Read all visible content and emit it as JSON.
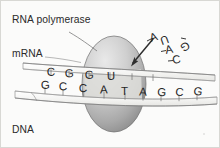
{
  "figure": {
    "background_color": "#fbfbfa",
    "ink_color": "#2a2a2a"
  },
  "labels": {
    "rna_polymerase": "RNA polymerase",
    "mrna": "mRNA",
    "dna_coding_strand_line1": "DNA",
    "dna_coding_strand_line2": "coding",
    "dna_coding_strand_line3": "strand"
  },
  "enzyme": {
    "name": "rna-polymerase-ellipse",
    "fill_light": "#d5d5d5",
    "fill_dark": "#8f8f8f",
    "stroke": "#6e6e6e"
  },
  "bubble": {
    "name": "transcription-bubble",
    "fill": "#e3e3e1"
  },
  "strands": {
    "mrna_strand": {
      "label": "mRNA",
      "bases": [
        "C",
        "G",
        "G",
        "U"
      ]
    },
    "dna_strand": {
      "label": "DNA coding strand",
      "bases": [
        "G",
        "C",
        "C",
        "A",
        "T",
        "A",
        "G",
        "C",
        "G"
      ]
    }
  },
  "free_nucleotides": [
    {
      "base": "A",
      "note": "incoming nucleotide with arrow into polymerase"
    },
    {
      "base": "U",
      "note": "floating rotated"
    },
    {
      "base": "G",
      "note": "floating rotated"
    },
    {
      "base": "A",
      "note": "floating rotated"
    },
    {
      "base": "C",
      "note": "floating rotated"
    }
  ],
  "arrow": {
    "name": "incoming-nucleotide-arrow",
    "color": "#2f2f2f"
  }
}
